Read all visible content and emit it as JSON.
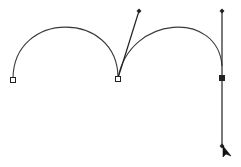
{
  "canvas": {
    "width": 241,
    "height": 167,
    "background": "#ffffff"
  },
  "path": {
    "stroke": "#3a3a3a",
    "segments": [
      {
        "name": "left-arc",
        "d": "M13,79 C13,10 118,10 118,78"
      },
      {
        "name": "right-arc",
        "d": "M118,78 C130,15 218,10 222,66"
      }
    ],
    "anchors": [
      {
        "name": "anchor-left",
        "x": 13,
        "y": 80,
        "style": "hollow"
      },
      {
        "name": "anchor-middle",
        "x": 118,
        "y": 79,
        "style": "hollow"
      },
      {
        "name": "anchor-right",
        "x": 222,
        "y": 78,
        "style": "solid"
      }
    ],
    "handles": [
      {
        "name": "handle-middle-out",
        "x1": 118,
        "y1": 78,
        "x2": 139,
        "y2": 11
      },
      {
        "name": "handle-right-in",
        "x1": 222,
        "y1": 78,
        "x2": 222,
        "y2": 11
      },
      {
        "name": "handle-right-out",
        "x1": 222,
        "y1": 78,
        "x2": 222,
        "y2": 146
      }
    ],
    "handle_points": [
      {
        "x": 139,
        "y": 11
      },
      {
        "x": 222,
        "y": 11
      },
      {
        "x": 222,
        "y": 146
      }
    ]
  },
  "cursor": {
    "icon": "direct-selection-arrow-icon",
    "x": 223,
    "y": 146
  }
}
